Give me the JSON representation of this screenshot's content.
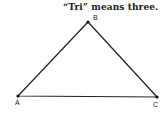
{
  "caption": "“Tri” means three.",
  "triangle": {
    "vertices": [
      {
        "label": "A",
        "x": 18,
        "y": 96
      },
      {
        "label": "B",
        "x": 88,
        "y": 22
      },
      {
        "label": "C",
        "x": 157,
        "y": 97
      }
    ]
  },
  "colors": {
    "stroke": "#222222",
    "background": "#ffffff"
  }
}
